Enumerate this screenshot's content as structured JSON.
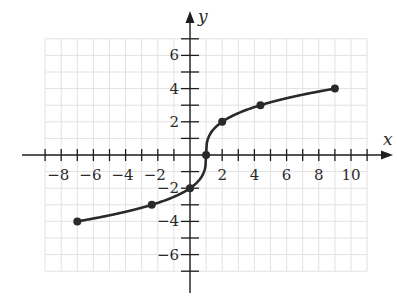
{
  "chart_data": {
    "type": "line",
    "title": "",
    "function": "f(x) = 2·∛(x − 1)",
    "xlabel": "x",
    "ylabel": "y",
    "xlim": [
      -9,
      11
    ],
    "ylim": [
      -7,
      7
    ],
    "grid": true,
    "x_ticks": [
      -9,
      -8,
      -7,
      -6,
      -5,
      -4,
      -3,
      -2,
      -1,
      1,
      2,
      3,
      4,
      5,
      6,
      7,
      8,
      9,
      10,
      11
    ],
    "x_tick_labels": [
      {
        "value": -8,
        "text": "−8"
      },
      {
        "value": -6,
        "text": "−6"
      },
      {
        "value": -4,
        "text": "−4"
      },
      {
        "value": -2,
        "text": "−2"
      },
      {
        "value": 2,
        "text": "2"
      },
      {
        "value": 4,
        "text": "4"
      },
      {
        "value": 6,
        "text": "6"
      },
      {
        "value": 8,
        "text": "8"
      },
      {
        "value": 10,
        "text": "10"
      }
    ],
    "y_ticks": [
      -7,
      -6,
      -5,
      -4,
      -3,
      -2,
      -1,
      1,
      2,
      3,
      4,
      5,
      6,
      7
    ],
    "y_tick_labels": [
      {
        "value": 6,
        "text": "6"
      },
      {
        "value": 4,
        "text": "4"
      },
      {
        "value": 2,
        "text": "2"
      },
      {
        "value": -2,
        "text": "−2"
      },
      {
        "value": -4,
        "text": "−4"
      },
      {
        "value": -6,
        "text": "−6"
      }
    ],
    "series": [
      {
        "name": "curve",
        "color": "#2a2a2a",
        "x": [
          -7,
          -2.375,
          0,
          1,
          2,
          4.375,
          9
        ],
        "y": [
          -4,
          -3,
          -2,
          0,
          2,
          3,
          4
        ]
      }
    ],
    "curve_domain": [
      -7,
      9
    ]
  },
  "colors": {
    "grid": "#e2e2e2",
    "axis": "#1e1e1e",
    "curve": "#2a2a2a"
  }
}
